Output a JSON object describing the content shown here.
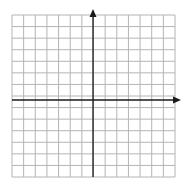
{
  "diagram": {
    "type": "coordinate-grid",
    "grid": {
      "columns": 14,
      "rows": 14,
      "left": 12,
      "top": 15,
      "right": 175,
      "bottom": 177,
      "line_color": "#b4b4b4"
    },
    "axes": {
      "color": "#1a1a1a",
      "y_axis_x": 93,
      "x_axis_y": 100,
      "x_axis_arrow_tip": 181,
      "y_axis_arrow_tip": 9,
      "labels_visible": false
    }
  }
}
